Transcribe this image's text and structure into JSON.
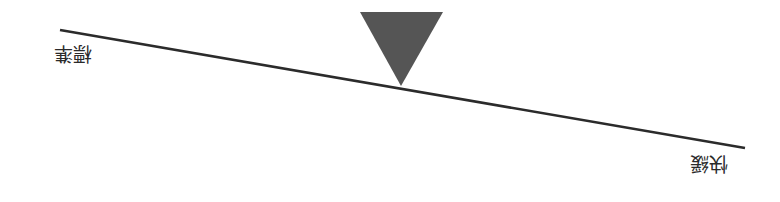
{
  "diagram": {
    "type": "lever-scale",
    "orientation": "rotated-180",
    "labels": {
      "left": "標準",
      "right": "快緩"
    },
    "beam": {
      "x1": 60,
      "y1": 30,
      "x2": 745,
      "y2": 148,
      "color": "#2b2b2b"
    },
    "pivot": {
      "shape": "triangle",
      "points": "360,12 443,12 401,86",
      "color": "#555555"
    }
  }
}
